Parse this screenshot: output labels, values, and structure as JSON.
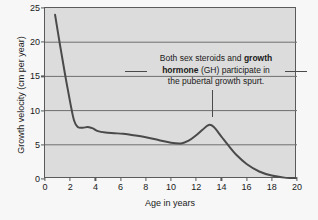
{
  "chart_data": {
    "type": "line",
    "title": "",
    "xlabel": "Age in years",
    "ylabel": "Growth velocity (cm per year)",
    "xlim": [
      0,
      20
    ],
    "ylim": [
      0,
      25
    ],
    "xticks": [
      0,
      2,
      4,
      6,
      8,
      10,
      12,
      14,
      16,
      18,
      20
    ],
    "yticks": [
      0,
      5,
      10,
      15,
      20,
      25
    ],
    "grid": "horizontal",
    "legend": "none",
    "series": [
      {
        "name": "Growth velocity",
        "color": "#4a4a4a",
        "x": [
          0.8,
          1.2,
          1.6,
          2.0,
          2.3,
          2.6,
          3.0,
          3.4,
          3.8,
          4.2,
          4.8,
          5.5,
          6.2,
          7.0,
          8.0,
          9.0,
          10.0,
          10.8,
          11.4,
          12.0,
          12.5,
          13.0,
          13.4,
          14.0,
          14.6,
          15.2,
          16.0,
          17.0,
          18.0,
          19.0,
          20.0
        ],
        "y": [
          24.0,
          19.5,
          15.2,
          11.2,
          8.6,
          7.6,
          7.5,
          7.6,
          7.4,
          7.0,
          6.8,
          6.7,
          6.6,
          6.4,
          6.1,
          5.7,
          5.3,
          5.2,
          5.6,
          6.4,
          7.2,
          7.9,
          7.6,
          6.2,
          4.8,
          3.5,
          2.2,
          1.1,
          0.5,
          0.2,
          0.1
        ]
      }
    ],
    "annotations": [
      {
        "name": "pubertal-spurt-note",
        "lines": [
          {
            "parts": [
              {
                "text": "Both sex steroids and ",
                "bold": false
              },
              {
                "text": "growth",
                "bold": true
              }
            ]
          },
          {
            "parts": [
              {
                "text": "hormone",
                "bold": true
              },
              {
                "text": " (GH) participate in",
                "bold": false
              }
            ]
          },
          {
            "parts": [
              {
                "text": "the pubertal growth spurt.",
                "bold": false
              }
            ]
          }
        ],
        "points_to_x": 13.0,
        "points_to_y": 8.0
      }
    ]
  },
  "credit": {
    "text": "Adapted from Richard Steckel, Ohio State University"
  }
}
